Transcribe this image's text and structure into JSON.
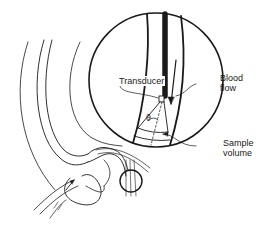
{
  "diagram": {
    "labels": {
      "transducer": "Transducer",
      "blood_flow": "Blood\nflow",
      "sample_volume": "Sample\nvolume",
      "angle": "θ"
    },
    "colors": {
      "stroke": "#1a1a1a",
      "background": "#ffffff"
    },
    "inset": {
      "shape": "magnified circle",
      "center": [
        156,
        80
      ],
      "radius": 67
    },
    "small_circle": {
      "center": [
        131,
        181
      ],
      "radius": 11
    }
  }
}
